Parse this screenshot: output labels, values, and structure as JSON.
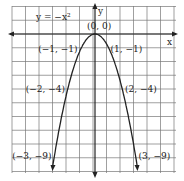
{
  "chart_data": {
    "type": "line",
    "equation_label": "y = −x²",
    "xlabel": "x",
    "ylabel": "y",
    "xlim": [
      -6,
      6
    ],
    "ylim": [
      -10,
      2
    ],
    "grid": true,
    "series": [
      {
        "name": "y = -x^2",
        "x": [
          -3,
          -2,
          -1,
          0,
          1,
          2,
          3
        ],
        "y": [
          -9,
          -4,
          -1,
          0,
          -1,
          -4,
          -9
        ]
      }
    ],
    "annotations": [
      {
        "x": 0,
        "y": 0,
        "text": "(0, 0)"
      },
      {
        "x": -1,
        "y": -1,
        "text": "(−1, −1)"
      },
      {
        "x": 1,
        "y": -1,
        "text": "(1, −1)"
      },
      {
        "x": -2,
        "y": -4,
        "text": "(−2, −4)"
      },
      {
        "x": 2,
        "y": -4,
        "text": "(2, −4)"
      },
      {
        "x": -3,
        "y": -9,
        "text": "(−3, −9)"
      },
      {
        "x": 3,
        "y": -9,
        "text": "(3, −9)"
      }
    ]
  }
}
